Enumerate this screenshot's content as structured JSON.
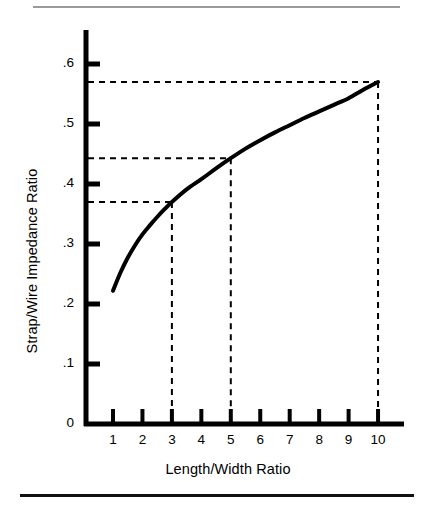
{
  "figure": {
    "rule_top": "horizontal-rule-thin-gray",
    "rule_bottom": "horizontal-rule-thick-black"
  },
  "chart_data": {
    "type": "line",
    "title": "",
    "subtitle": "",
    "xlabel": "Length/Width Ratio",
    "ylabel": "Strap/Wire Impedance Ratio",
    "xlim": [
      0.3,
      11.1
    ],
    "ylim": [
      0,
      0.65
    ],
    "grid": false,
    "legend": null,
    "legend_position": "none",
    "x_ticks": [
      1,
      2,
      3,
      4,
      5,
      6,
      7,
      8,
      9,
      10
    ],
    "x_tick_labels": [
      "1",
      "2",
      "3",
      "4",
      "5",
      "6",
      "7",
      "8",
      "9",
      "10"
    ],
    "y_ticks": [
      0,
      0.1,
      0.2,
      0.3,
      0.4,
      0.5,
      0.6
    ],
    "y_tick_labels": [
      "0",
      ".1",
      ".2",
      ".3",
      ".4",
      ".5",
      ".6"
    ],
    "series": [
      {
        "name": "Strap/Wire Impedance Ratio",
        "color": "#000000",
        "linewidth": 4,
        "x": [
          1.0,
          1.25,
          1.5,
          1.75,
          2.0,
          2.25,
          2.5,
          2.75,
          3.0,
          3.5,
          4.0,
          4.5,
          5.0,
          5.5,
          6.0,
          6.5,
          7.0,
          7.5,
          8.0,
          8.5,
          9.0,
          9.5,
          10.0
        ],
        "values": [
          0.222,
          0.252,
          0.277,
          0.298,
          0.316,
          0.331,
          0.345,
          0.358,
          0.37,
          0.391,
          0.408,
          0.426,
          0.443,
          0.459,
          0.473,
          0.486,
          0.498,
          0.51,
          0.521,
          0.532,
          0.543,
          0.557,
          0.57
        ]
      }
    ],
    "annotations": [
      {
        "name": "callout-x3",
        "x": 3,
        "y": 0.37,
        "style": "dashed",
        "color": "#000000"
      },
      {
        "name": "callout-x5",
        "x": 5,
        "y": 0.443,
        "style": "dashed",
        "color": "#000000"
      },
      {
        "name": "callout-x10",
        "x": 10,
        "y": 0.57,
        "style": "dashed",
        "color": "#000000"
      }
    ]
  }
}
